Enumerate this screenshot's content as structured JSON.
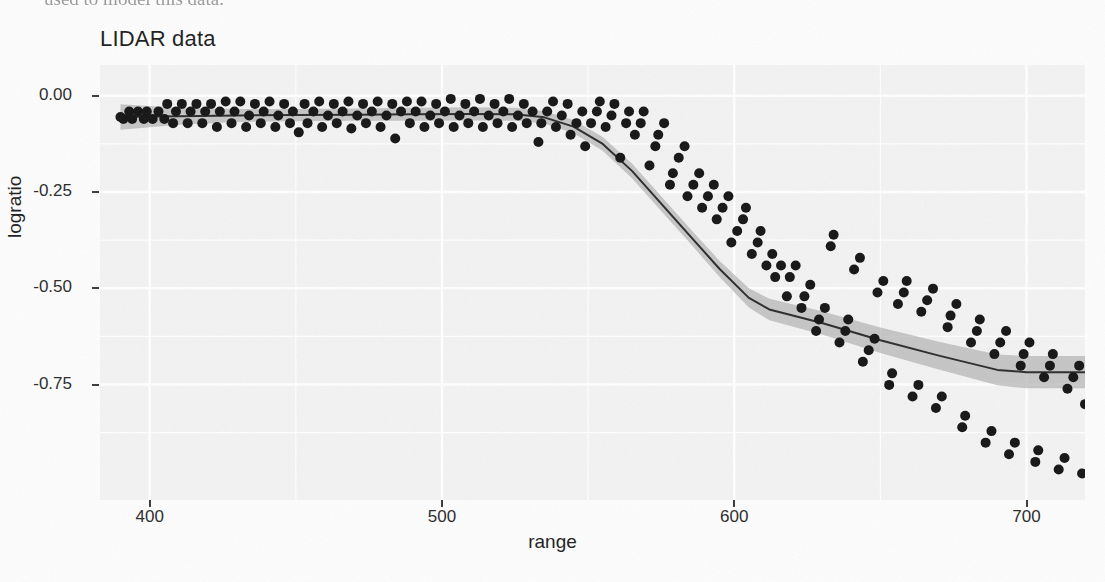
{
  "page": {
    "text_fragment": "used to model this data."
  },
  "figure": {
    "title": "LIDAR data"
  },
  "chart_data": {
    "type": "scatter",
    "title": "LIDAR data",
    "xlabel": "range",
    "ylabel": "logratio",
    "xlim": [
      383,
      720
    ],
    "ylim": [
      -1.05,
      0.08
    ],
    "xticks": [
      400,
      500,
      600,
      700
    ],
    "xticklabels": [
      "400",
      "500",
      "600",
      "700"
    ],
    "yticks": [
      0.0,
      -0.25,
      -0.5,
      -0.75
    ],
    "yticklabels": [
      "0.00",
      "-0.25",
      "-0.50",
      "-0.75"
    ],
    "grid": true,
    "legend": false,
    "panel_background": "#f3f3f3",
    "grid_color": "#ffffff",
    "point_color": "#141414",
    "point_radius": 5,
    "line_color": "#2b2b2b",
    "line_width": 2,
    "ribbon_color": "#a8a8a8",
    "ribbon_opacity": 0.62,
    "series": [
      {
        "name": "observations",
        "type": "scatter",
        "x": [
          390,
          391,
          393,
          394,
          396,
          398,
          399,
          401,
          403,
          405,
          406,
          408,
          409,
          411,
          413,
          414,
          416,
          418,
          419,
          421,
          423,
          424,
          426,
          428,
          429,
          431,
          433,
          434,
          436,
          438,
          439,
          441,
          443,
          444,
          446,
          448,
          449,
          451,
          453,
          454,
          456,
          458,
          459,
          461,
          463,
          464,
          466,
          468,
          469,
          471,
          473,
          474,
          476,
          478,
          479,
          481,
          483,
          484,
          486,
          488,
          489,
          491,
          493,
          494,
          496,
          498,
          499,
          501,
          503,
          504,
          506,
          508,
          509,
          511,
          513,
          514,
          516,
          518,
          519,
          521,
          523,
          524,
          526,
          528,
          529,
          531,
          533,
          534,
          536,
          538,
          539,
          541,
          543,
          544,
          546,
          548,
          549,
          551,
          553,
          554,
          556,
          558,
          559,
          561,
          563,
          564,
          566,
          568,
          569,
          571,
          573,
          574,
          576,
          578,
          579,
          581,
          583,
          584,
          586,
          588,
          589,
          591,
          593,
          594,
          596,
          598,
          599,
          601,
          603,
          604,
          606,
          608,
          609,
          611,
          613,
          614,
          616,
          618,
          619,
          621,
          623,
          624,
          626,
          628,
          629,
          631,
          633,
          634,
          636,
          638,
          639,
          641,
          643,
          644,
          646,
          648,
          649,
          651,
          653,
          654,
          656,
          658,
          659,
          661,
          663,
          664,
          666,
          668,
          669,
          671,
          673,
          674,
          676,
          678,
          679,
          681,
          683,
          684,
          686,
          688,
          689,
          691,
          693,
          694,
          696,
          698,
          699,
          701,
          703,
          704,
          706,
          708,
          709,
          711,
          713,
          714,
          716,
          718,
          719,
          720
        ],
        "y": [
          -0.055,
          -0.06,
          -0.041,
          -0.06,
          -0.041,
          -0.06,
          -0.041,
          -0.06,
          -0.041,
          -0.06,
          -0.021,
          -0.071,
          -0.041,
          -0.021,
          -0.071,
          -0.041,
          -0.021,
          -0.071,
          -0.041,
          -0.021,
          -0.081,
          -0.041,
          -0.015,
          -0.071,
          -0.041,
          -0.015,
          -0.081,
          -0.051,
          -0.021,
          -0.071,
          -0.041,
          -0.015,
          -0.081,
          -0.051,
          -0.021,
          -0.071,
          -0.041,
          -0.095,
          -0.021,
          -0.071,
          -0.041,
          -0.015,
          -0.081,
          -0.051,
          -0.021,
          -0.071,
          -0.041,
          -0.015,
          -0.085,
          -0.051,
          -0.021,
          -0.071,
          -0.041,
          -0.015,
          -0.081,
          -0.051,
          -0.021,
          -0.111,
          -0.041,
          -0.015,
          -0.071,
          -0.041,
          -0.015,
          -0.081,
          -0.051,
          -0.021,
          -0.071,
          -0.041,
          -0.008,
          -0.081,
          -0.051,
          -0.021,
          -0.071,
          -0.041,
          -0.008,
          -0.081,
          -0.051,
          -0.021,
          -0.071,
          -0.041,
          -0.008,
          -0.081,
          -0.051,
          -0.021,
          -0.071,
          -0.041,
          -0.12,
          -0.071,
          -0.041,
          -0.015,
          -0.081,
          -0.051,
          -0.021,
          -0.101,
          -0.071,
          -0.041,
          -0.131,
          -0.071,
          -0.041,
          -0.015,
          -0.081,
          -0.051,
          -0.021,
          -0.161,
          -0.071,
          -0.041,
          -0.101,
          -0.071,
          -0.041,
          -0.181,
          -0.131,
          -0.101,
          -0.071,
          -0.231,
          -0.201,
          -0.161,
          -0.131,
          -0.261,
          -0.231,
          -0.201,
          -0.291,
          -0.261,
          -0.231,
          -0.321,
          -0.291,
          -0.261,
          -0.381,
          -0.351,
          -0.321,
          -0.291,
          -0.411,
          -0.381,
          -0.351,
          -0.441,
          -0.411,
          -0.471,
          -0.441,
          -0.521,
          -0.471,
          -0.441,
          -0.551,
          -0.521,
          -0.491,
          -0.611,
          -0.581,
          -0.551,
          -0.391,
          -0.361,
          -0.641,
          -0.611,
          -0.581,
          -0.451,
          -0.421,
          -0.691,
          -0.661,
          -0.631,
          -0.511,
          -0.481,
          -0.751,
          -0.721,
          -0.541,
          -0.511,
          -0.481,
          -0.781,
          -0.751,
          -0.561,
          -0.531,
          -0.501,
          -0.811,
          -0.781,
          -0.601,
          -0.571,
          -0.541,
          -0.861,
          -0.831,
          -0.641,
          -0.611,
          -0.581,
          -0.901,
          -0.871,
          -0.671,
          -0.641,
          -0.611,
          -0.931,
          -0.901,
          -0.701,
          -0.671,
          -0.641,
          -0.951,
          -0.921,
          -0.731,
          -0.701,
          -0.671,
          -0.971,
          -0.941,
          -0.761,
          -0.731,
          -0.701,
          -0.981,
          -0.801
        ]
      },
      {
        "name": "fitted-curve",
        "type": "line",
        "x": [
          390,
          410,
          430,
          450,
          470,
          490,
          510,
          525,
          535,
          545,
          555,
          565,
          575,
          585,
          595,
          605,
          612,
          630,
          650,
          670,
          690,
          700,
          720
        ],
        "y": [
          -0.055,
          -0.053,
          -0.051,
          -0.05,
          -0.049,
          -0.048,
          -0.047,
          -0.048,
          -0.056,
          -0.08,
          -0.125,
          -0.195,
          -0.28,
          -0.365,
          -0.45,
          -0.525,
          -0.555,
          -0.59,
          -0.635,
          -0.675,
          -0.712,
          -0.718,
          -0.718
        ]
      },
      {
        "name": "confidence-ribbon-upper",
        "type": "line",
        "x": [
          390,
          410,
          430,
          450,
          470,
          490,
          510,
          525,
          535,
          545,
          555,
          565,
          575,
          585,
          595,
          605,
          612,
          630,
          650,
          670,
          690,
          700,
          720
        ],
        "y": [
          -0.022,
          -0.031,
          -0.034,
          -0.034,
          -0.033,
          -0.031,
          -0.03,
          -0.031,
          -0.04,
          -0.063,
          -0.107,
          -0.176,
          -0.261,
          -0.346,
          -0.429,
          -0.5,
          -0.527,
          -0.56,
          -0.602,
          -0.639,
          -0.672,
          -0.676,
          -0.676
        ]
      },
      {
        "name": "confidence-ribbon-lower",
        "type": "line",
        "x": [
          390,
          410,
          430,
          450,
          470,
          490,
          510,
          525,
          535,
          545,
          555,
          565,
          575,
          585,
          595,
          605,
          612,
          630,
          650,
          670,
          690,
          700,
          720
        ],
        "y": [
          -0.088,
          -0.075,
          -0.068,
          -0.066,
          -0.065,
          -0.065,
          -0.064,
          -0.065,
          -0.072,
          -0.097,
          -0.143,
          -0.214,
          -0.299,
          -0.384,
          -0.471,
          -0.55,
          -0.583,
          -0.62,
          -0.668,
          -0.711,
          -0.752,
          -0.76,
          -0.76
        ]
      }
    ]
  }
}
